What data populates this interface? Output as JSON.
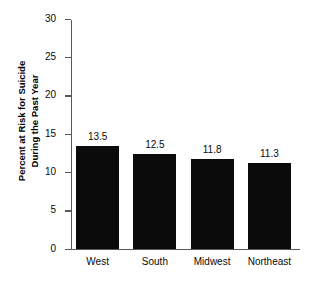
{
  "chart_data": {
    "type": "bar",
    "title": "",
    "subtitle": "",
    "xlabel": "",
    "ylabel": "Percent at Risk for Suicide During the Past Year",
    "ylabel_line1": "Percent at Risk for Suicide",
    "ylabel_line2": "During the Past Year",
    "categories": [
      "West",
      "South",
      "Midwest",
      "Northeast"
    ],
    "values": [
      13.5,
      12.5,
      11.8,
      11.3
    ],
    "value_labels": [
      "13.5",
      "12.5",
      "11.8",
      "11.3"
    ],
    "ylim": [
      0,
      30
    ],
    "ytick_values": [
      0,
      5,
      10,
      15,
      20,
      25,
      30
    ],
    "ytick_labels": [
      "0",
      "5",
      "10",
      "15",
      "20",
      "25",
      "30"
    ],
    "grid": false,
    "legend": null,
    "legend_position": "none",
    "bar_color": "#0b0b0b",
    "axis_color": "#55595c",
    "text_color": "#0a0a0a",
    "background_color": "#ffffff"
  }
}
